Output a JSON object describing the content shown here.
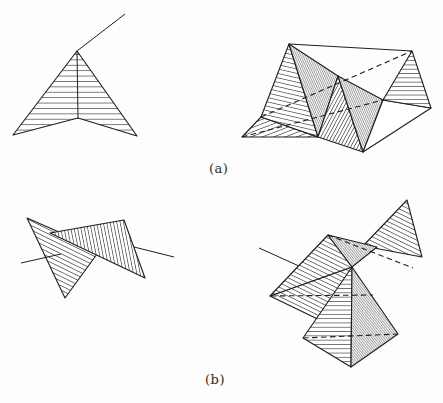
{
  "labels": {
    "a": "(a)",
    "b": "(b)"
  },
  "ink": "#1f1f1f",
  "hatch_ink": "#2e2e2e",
  "figures": [
    {
      "name": "dart-folded-triangle-a-left",
      "shapes": [
        {
          "kind": "polygon",
          "hatch": "h5",
          "points": [
            [
              77,
              51
            ],
            [
              13,
              135
            ],
            [
              78,
              118
            ],
            [
              137,
              136
            ]
          ]
        }
      ],
      "lines": [
        {
          "from": [
            77,
            51
          ],
          "to": [
            78,
            118
          ],
          "dashed": false
        },
        {
          "from": [
            77,
            51
          ],
          "to": [
            125,
            14
          ],
          "dashed": false
        }
      ]
    },
    {
      "name": "folded-surface-a-right",
      "shapes": [
        {
          "kind": "polygon",
          "hatch": "fwd20",
          "points": [
            [
              242,
              137
            ],
            [
              261,
              117
            ],
            [
              318,
              137
            ]
          ]
        },
        {
          "kind": "polygon",
          "hatch": "back12",
          "points": [
            [
              289,
              44
            ],
            [
              261,
              117
            ],
            [
              318,
              137
            ]
          ]
        },
        {
          "kind": "polygon",
          "hatch": "dense65",
          "points": [
            [
              289,
              44
            ],
            [
              338,
              76
            ],
            [
              318,
              137
            ]
          ]
        },
        {
          "kind": "polygon",
          "hatch": "fwd60",
          "points": [
            [
              338,
              76
            ],
            [
              318,
              137
            ],
            [
              363,
              152
            ]
          ]
        },
        {
          "kind": "polygon",
          "hatch": "dense65",
          "points": [
            [
              338,
              76
            ],
            [
              383,
              100
            ],
            [
              363,
              152
            ]
          ]
        },
        {
          "kind": "polygon",
          "hatch": "none",
          "points": [
            [
              383,
              100
            ],
            [
              431,
              108
            ],
            [
              363,
              152
            ]
          ]
        },
        {
          "kind": "polygon",
          "hatch": "h4",
          "points": [
            [
              412,
              51
            ],
            [
              431,
              108
            ],
            [
              383,
              100
            ]
          ]
        }
      ],
      "lines": [
        {
          "from": [
            289,
            44
          ],
          "to": [
            412,
            51
          ],
          "dashed": false
        },
        {
          "from": [
            261,
            117
          ],
          "to": [
            412,
            51
          ],
          "dashed": true
        },
        {
          "from": [
            242,
            137
          ],
          "to": [
            383,
            100
          ],
          "dashed": true
        }
      ]
    },
    {
      "name": "self-intersecting-dart-b-left",
      "shapes": [
        {
          "kind": "polygon",
          "hatch": "back25",
          "points": [
            [
              27,
              218
            ],
            [
              65,
              298
            ],
            [
              100,
              250
            ]
          ]
        },
        {
          "kind": "polygon",
          "hatch": "steep78",
          "points": [
            [
              50,
              233
            ],
            [
              124,
              220
            ],
            [
              145,
              278
            ]
          ]
        }
      ],
      "lines": [
        {
          "from": [
            21,
            263
          ],
          "to": [
            61,
            254
          ],
          "dashed": false
        },
        {
          "from": [
            134,
            247
          ],
          "to": [
            174,
            257
          ],
          "dashed": false
        }
      ]
    },
    {
      "name": "folded-surface-b-right",
      "shapes": [
        {
          "kind": "polygon",
          "hatch": "back25",
          "points": [
            [
              270,
              296
            ],
            [
              352,
              267
            ],
            [
              330,
              325
            ]
          ]
        },
        {
          "kind": "polygon",
          "hatch": "back25",
          "points": [
            [
              328,
              235
            ],
            [
              270,
              296
            ],
            [
              352,
              267
            ]
          ]
        },
        {
          "kind": "polygon",
          "hatch": "back25",
          "points": [
            [
              407,
              200
            ],
            [
              422,
              257
            ],
            [
              363,
              246
            ]
          ]
        },
        {
          "kind": "polygon",
          "hatch": "dense50",
          "points": [
            [
              328,
              235
            ],
            [
              377,
              247
            ],
            [
              352,
              267
            ]
          ]
        },
        {
          "kind": "polygon",
          "hatch": "h4",
          "points": [
            [
              352,
              267
            ],
            [
              303,
              338
            ],
            [
              351,
              367
            ]
          ]
        },
        {
          "kind": "polygon",
          "hatch": "dense50",
          "points": [
            [
              352,
              267
            ],
            [
              351,
              367
            ],
            [
              398,
              334
            ]
          ]
        }
      ],
      "lines": [
        {
          "from": [
            271,
            296
          ],
          "to": [
            373,
            295
          ],
          "dashed": true
        },
        {
          "from": [
            303,
            338
          ],
          "to": [
            398,
            334
          ],
          "dashed": true
        },
        {
          "from": [
            328,
            235
          ],
          "to": [
            413,
            268
          ],
          "dashed": true
        },
        {
          "from": [
            259,
            248
          ],
          "to": [
            299,
            266
          ],
          "dashed": false
        }
      ]
    }
  ]
}
